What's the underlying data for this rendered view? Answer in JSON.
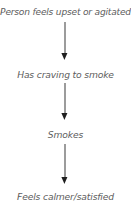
{
  "diagram": {
    "type": "vertical-flowchart",
    "orientation": "top-to-bottom",
    "background_color": "#ffffff",
    "text_color": "#5d5d5d",
    "arrow_color": "#1f1f1f",
    "nodes": [
      {
        "label": "Person feels upset or agitated"
      },
      {
        "label": "Has craving to smoke"
      },
      {
        "label": "Smokes"
      },
      {
        "label": "Feels calmer/satisfied"
      }
    ],
    "connectors": [
      {
        "icon": "arrow-down-icon",
        "from": "Person feels upset or agitated",
        "to": "Has craving to smoke"
      },
      {
        "icon": "arrow-down-icon",
        "from": "Has craving to smoke",
        "to": "Smokes"
      },
      {
        "icon": "arrow-down-icon",
        "from": "Smokes",
        "to": "Feels calmer/satisfied"
      }
    ]
  }
}
